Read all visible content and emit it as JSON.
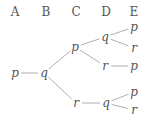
{
  "headers": [
    {
      "label": "A",
      "x": 15,
      "y": 12
    },
    {
      "label": "B",
      "x": 46,
      "y": 12
    },
    {
      "label": "C",
      "x": 76,
      "y": 12
    },
    {
      "label": "D",
      "x": 106,
      "y": 12
    },
    {
      "label": "E",
      "x": 134,
      "y": 12
    }
  ],
  "nodes": [
    {
      "id": "a_p",
      "label": "p",
      "x": 15,
      "y": 73
    },
    {
      "id": "b_q",
      "label": "q",
      "x": 44,
      "y": 73
    },
    {
      "id": "c_p",
      "label": "p",
      "x": 75,
      "y": 47
    },
    {
      "id": "c_r",
      "label": "r",
      "x": 76,
      "y": 103
    },
    {
      "id": "d_q1",
      "label": "q",
      "x": 105,
      "y": 37
    },
    {
      "id": "d_r",
      "label": "r",
      "x": 105,
      "y": 66
    },
    {
      "id": "d_q2",
      "label": "q",
      "x": 106,
      "y": 103
    },
    {
      "id": "e_p1",
      "label": "p",
      "x": 134,
      "y": 27
    },
    {
      "id": "e_r1",
      "label": "r",
      "x": 134,
      "y": 48
    },
    {
      "id": "e_p2",
      "label": "p",
      "x": 134,
      "y": 66
    },
    {
      "id": "e_p3",
      "label": "p",
      "x": 134,
      "y": 92
    },
    {
      "id": "e_r2",
      "label": "r",
      "x": 134,
      "y": 110
    }
  ],
  "edges": [
    {
      "from": "a_p",
      "to": "b_q"
    },
    {
      "from": "b_q",
      "to": "c_p"
    },
    {
      "from": "b_q",
      "to": "c_r"
    },
    {
      "from": "c_p",
      "to": "d_q1"
    },
    {
      "from": "c_p",
      "to": "d_r"
    },
    {
      "from": "c_r",
      "to": "d_q2"
    },
    {
      "from": "d_q1",
      "to": "e_p1"
    },
    {
      "from": "d_q1",
      "to": "e_r1"
    },
    {
      "from": "d_r",
      "to": "e_p2"
    },
    {
      "from": "d_q2",
      "to": "e_p3"
    },
    {
      "from": "d_q2",
      "to": "e_r2"
    }
  ]
}
